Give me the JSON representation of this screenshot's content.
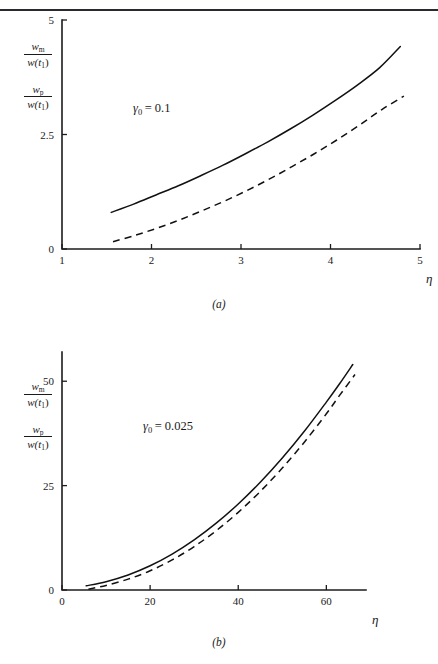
{
  "page": {
    "top_rule": true,
    "background": "#ffffff",
    "ink_color": "#111111"
  },
  "panels": [
    {
      "id": "a",
      "caption": "(a)",
      "annotation": {
        "symbol": "γ",
        "subscript": "0",
        "equals": "=",
        "value": "0.1"
      },
      "ylabel": {
        "frac1": {
          "num_var": "w",
          "num_sub": "m",
          "den": "w(t",
          "den_sub": "1",
          "den_close": ")"
        },
        "frac2": {
          "num_var": "w",
          "num_sub": "p",
          "den": "w(t",
          "den_sub": "1",
          "den_close": ")"
        }
      },
      "xlabel": "η",
      "chart_data": {
        "type": "line",
        "title": "(a)",
        "xlabel": "η",
        "ylabel": "w_m/w(t_1), w_p/w(t_1)",
        "xlim": [
          1,
          5
        ],
        "ylim": [
          0,
          5
        ],
        "xticks": [
          1,
          2,
          3,
          4,
          5
        ],
        "xtick_labels": [
          "1",
          "2",
          "3",
          "4",
          "5"
        ],
        "yticks": [
          0,
          2.5,
          5
        ],
        "ytick_labels": [
          "0",
          "2.5",
          "5"
        ],
        "grid": false,
        "legend": "none",
        "annotation_text": "γ₀ = 0.1",
        "series": [
          {
            "name": "w_m/w(t1)",
            "style": "solid",
            "x": [
              1.55,
              1.8,
              2.05,
              2.3,
              2.55,
              2.8,
              3.05,
              3.3,
              3.55,
              3.8,
              4.05,
              4.3,
              4.55,
              4.78
            ],
            "y": [
              0.8,
              0.98,
              1.18,
              1.38,
              1.6,
              1.83,
              2.08,
              2.34,
              2.62,
              2.92,
              3.24,
              3.58,
              3.96,
              4.42
            ]
          },
          {
            "name": "w_p/w(t1)",
            "style": "dashed",
            "x": [
              1.57,
              1.82,
              2.07,
              2.32,
              2.57,
              2.82,
              3.07,
              3.32,
              3.57,
              3.82,
              4.07,
              4.32,
              4.57,
              4.82
            ],
            "y": [
              0.16,
              0.3,
              0.46,
              0.64,
              0.84,
              1.05,
              1.28,
              1.53,
              1.8,
              2.08,
              2.38,
              2.7,
              3.04,
              3.34
            ]
          }
        ]
      }
    },
    {
      "id": "b",
      "caption": "(b)",
      "annotation": {
        "symbol": "γ",
        "subscript": "0",
        "equals": "=",
        "value": "0.025"
      },
      "ylabel": {
        "frac1": {
          "num_var": "w",
          "num_sub": "m",
          "den": "w(t",
          "den_sub": "1",
          "den_close": ")"
        },
        "frac2": {
          "num_var": "w",
          "num_sub": "p",
          "den": "w(t",
          "den_sub": "1",
          "den_close": ")"
        }
      },
      "xlabel": "η",
      "chart_data": {
        "type": "line",
        "title": "(b)",
        "xlabel": "η",
        "ylabel": "w_m/w(t_1), w_p/w(t_1)",
        "xlim": [
          0,
          69
        ],
        "ylim": [
          0,
          57
        ],
        "xticks": [
          0,
          20,
          40,
          60
        ],
        "xtick_labels": [
          "0",
          "20",
          "40",
          "60"
        ],
        "yticks": [
          0,
          25,
          50
        ],
        "ytick_labels": [
          "0",
          "25",
          "50"
        ],
        "grid": false,
        "legend": "none",
        "annotation_text": "γ₀ = 0.025",
        "series": [
          {
            "name": "w_m/w(t1)",
            "style": "solid",
            "x": [
              5.5,
              10,
              15,
              20,
              25,
              30,
              35,
              40,
              45,
              50,
              55,
              60,
              63,
              66
            ],
            "y": [
              1.0,
              2.0,
              3.6,
              5.8,
              8.6,
              12.0,
              16.0,
              20.6,
              25.8,
              31.6,
              38.0,
              45.0,
              49.4,
              54.0
            ]
          },
          {
            "name": "w_p/w(t1)",
            "style": "dashed",
            "x": [
              6.0,
              10,
              15,
              20,
              25,
              30,
              35,
              40,
              45,
              50,
              55,
              60,
              63,
              66.5
            ],
            "y": [
              0.2,
              1.1,
              2.6,
              4.6,
              7.2,
              10.4,
              14.2,
              18.6,
              23.6,
              29.2,
              35.4,
              42.2,
              46.6,
              51.6
            ]
          }
        ]
      }
    }
  ]
}
